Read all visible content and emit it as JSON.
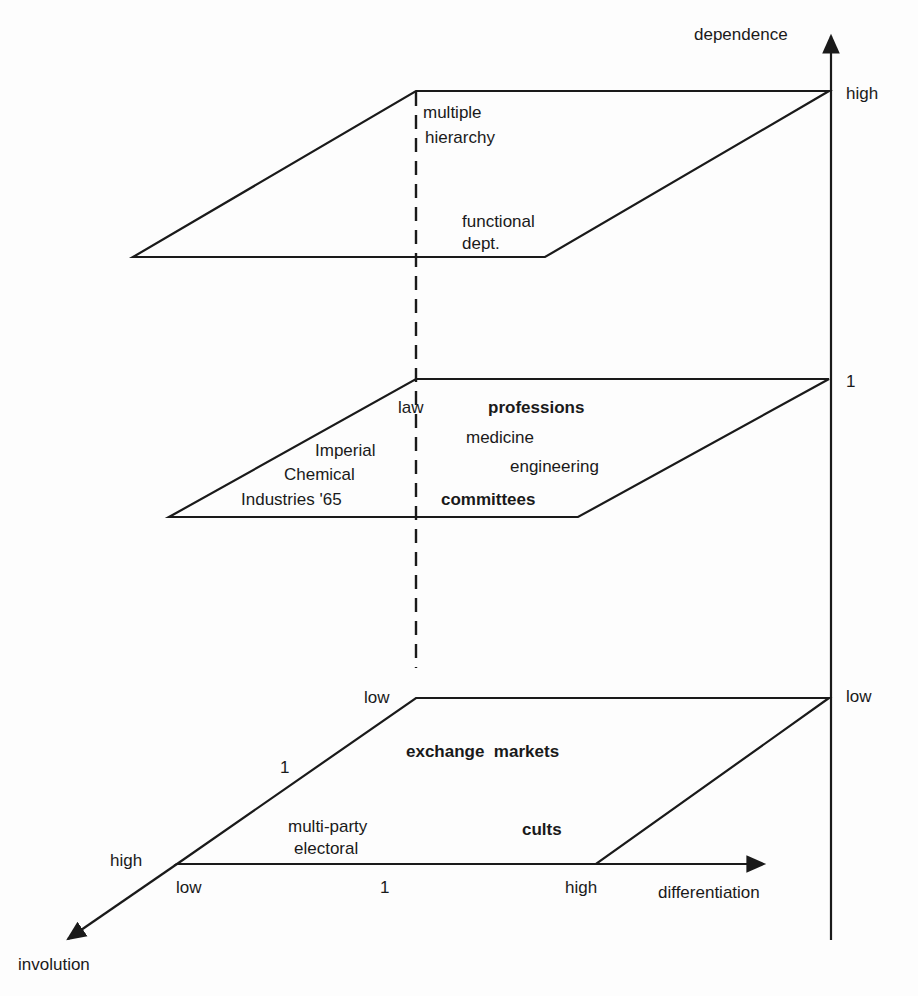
{
  "axes": {
    "dependence": {
      "label": "dependence",
      "ticks": [
        "low",
        "1",
        "high"
      ]
    },
    "differentiation": {
      "label": "differentiation",
      "ticks": [
        "low",
        "1",
        "high"
      ]
    },
    "involution": {
      "label": "involution",
      "ticks": [
        "low",
        "1",
        "high"
      ]
    }
  },
  "planes": {
    "top": {
      "items": [
        {
          "text_line1": "multiple",
          "text_line2": "hierarchy"
        },
        {
          "text_line1": "functional",
          "text_line2": "dept."
        }
      ]
    },
    "middle": {
      "law": "law",
      "professions": "professions",
      "medicine": "medicine",
      "engineering": "engineering",
      "committees": "committees",
      "ici_line1": "Imperial",
      "ici_line2": "Chemical",
      "ici_line3": "Industries '65"
    },
    "bottom": {
      "exchange_markets": "exchange  markets",
      "cults": "cults",
      "multiparty_line1": "multi-party",
      "multiparty_line2": "electoral"
    }
  },
  "colors": {
    "ink": "#1a1a1a",
    "paper": "#fdfdfd"
  }
}
